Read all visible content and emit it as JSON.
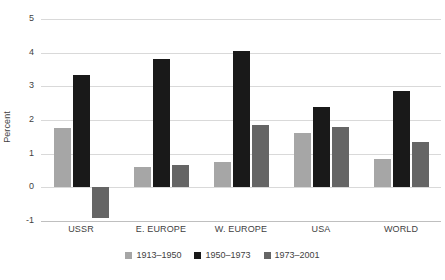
{
  "chart_data": {
    "type": "bar",
    "title": "",
    "subtitle": "",
    "xlabel": "",
    "ylabel": "Percent",
    "ylim": [
      -1,
      5
    ],
    "yticks": [
      "5",
      "4",
      "3",
      "2",
      "1",
      "0",
      "-1"
    ],
    "ytick_values": [
      5,
      4,
      3,
      2,
      1,
      0,
      -1
    ],
    "grid": true,
    "legend_position": "bottom",
    "categories": [
      "USSR",
      "E. EUROPE",
      "W. EUROPE",
      "USA",
      "WORLD"
    ],
    "series": [
      {
        "name": "1913–1950",
        "color": "#a6a6a6",
        "values": [
          1.75,
          0.6,
          0.75,
          1.6,
          0.85
        ]
      },
      {
        "name": "1950–1973",
        "color": "#191919",
        "values": [
          3.35,
          3.8,
          4.05,
          2.4,
          2.85
        ]
      },
      {
        "name": "1973–2001",
        "color": "#656565",
        "values": [
          -0.9,
          0.65,
          1.85,
          1.8,
          1.35
        ]
      }
    ]
  },
  "colors": {
    "series_1913_1950": "#a6a6a6",
    "series_1950_1973": "#191919",
    "series_1973_2001": "#656565",
    "gridline": "#d9d9d9",
    "baseline": "#bfbfbf",
    "text": "#3f3f3f",
    "background": "#ffffff"
  }
}
